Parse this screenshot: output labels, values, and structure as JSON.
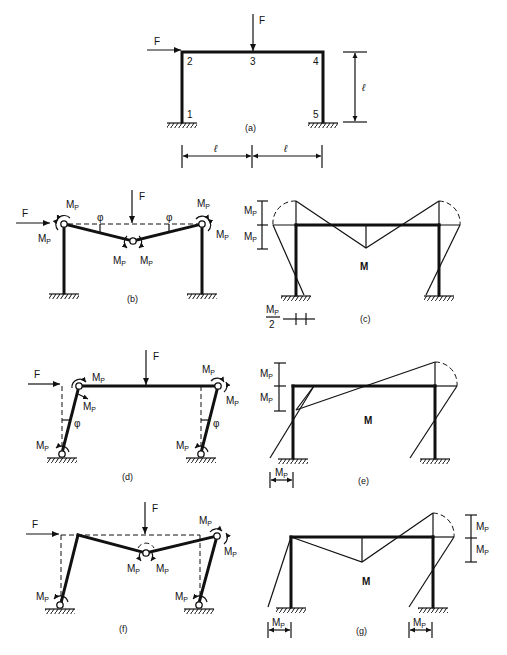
{
  "figure": {
    "panels": [
      {
        "id": "a",
        "caption": "(a)",
        "title": "Portal frame with loads",
        "force_labels": [
          "F",
          "F"
        ],
        "node_labels": [
          "1",
          "2",
          "3",
          "4",
          "5"
        ],
        "height_label": "ℓ",
        "span_labels": [
          "ℓ",
          "ℓ"
        ]
      },
      {
        "id": "b",
        "caption": "(b)",
        "title": "Beam mechanism",
        "force_labels": [
          "F",
          "F"
        ],
        "angle_labels": [
          "φ",
          "φ"
        ],
        "moment_label": "M",
        "moment_sub": "P"
      },
      {
        "id": "c",
        "caption": "(c)",
        "title": "Moment diagram for beam mechanism",
        "diagram_label": "M",
        "scale_labels": [
          "M",
          "M"
        ],
        "scale_sub": "P",
        "half_label_num": "M",
        "half_label_den": "2"
      },
      {
        "id": "d",
        "caption": "(d)",
        "title": "Sway mechanism",
        "force_labels": [
          "F",
          "F"
        ],
        "angle_labels": [
          "φ",
          "φ"
        ],
        "moment_label": "M",
        "moment_sub": "P"
      },
      {
        "id": "e",
        "caption": "(e)",
        "title": "Moment diagram for sway mechanism",
        "diagram_label": "M",
        "scale_labels": [
          "M",
          "M",
          "M"
        ],
        "scale_sub": "P"
      },
      {
        "id": "f",
        "caption": "(f)",
        "title": "Combined mechanism",
        "force_labels": [
          "F",
          "F"
        ],
        "moment_label": "M",
        "moment_sub": "P"
      },
      {
        "id": "g",
        "caption": "(g)",
        "title": "Moment diagram for combined mechanism",
        "diagram_label": "M",
        "scale_labels": [
          "M",
          "M",
          "M",
          "M"
        ],
        "scale_sub": "P"
      }
    ]
  }
}
